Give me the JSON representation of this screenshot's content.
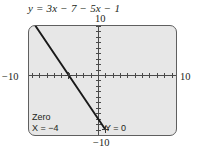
{
  "equation": {
    "lhs": "y",
    "eq": "=",
    "rhs": "3x − 7 − 5x − 1",
    "full": "y = 3x − 7 − 5x − 1"
  },
  "axis_labels": {
    "top": "10",
    "bottom": "−10",
    "left": "−10",
    "right": "10"
  },
  "readout": {
    "title": "Zero",
    "x_value": "X = −4",
    "y_value": "Y = 0"
  },
  "colors": {
    "screen_background": "#e7e7e7",
    "screen_border": "#5f5f5f",
    "axis": "#4a4a4a",
    "curve": "#1a1a1a",
    "text": "#231f20",
    "page_background": "#ffffff"
  },
  "chart_data": {
    "type": "line",
    "title": "y = 3x − 7 − 5x − 1",
    "simplified": "y = −2x − 8",
    "xlabel": "",
    "ylabel": "",
    "xlim": [
      -10,
      10
    ],
    "ylim": [
      -10,
      10
    ],
    "xtick_step": 1,
    "ytick_step": 1,
    "grid": false,
    "legend": "none",
    "series": [
      {
        "name": "y = −2x − 8",
        "slope": -2,
        "intercept": -8,
        "x": [
          -10,
          10
        ],
        "y": [
          12,
          -28
        ],
        "visible_x": [
          -9.0,
          1.0
        ],
        "visible_y": [
          10,
          -10
        ]
      }
    ],
    "annotations": [
      {
        "label": "Zero",
        "x": -4,
        "y": 0,
        "x_text": "X = −4",
        "y_text": "Y = 0"
      }
    ]
  }
}
